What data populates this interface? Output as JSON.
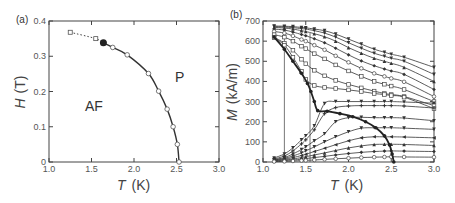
{
  "chart_data": [
    {
      "panel": "(a)",
      "type": "line",
      "title": "",
      "xlabel": "T (K)",
      "ylabel": "H (T)",
      "xlim": [
        1.0,
        3.0
      ],
      "ylim": [
        0,
        0.4
      ],
      "xticks": [
        "1.0",
        "1.5",
        "2.0",
        "2.5",
        "3.0"
      ],
      "yticks": [
        "0",
        "0.1",
        "0.2",
        "0.3",
        "0.4"
      ],
      "grid": false,
      "annotations": [
        "AF",
        "P"
      ],
      "series": [
        {
          "name": "phase boundary (solid)",
          "style": "solid with open circles",
          "x": [
            1.64,
            1.75,
            1.92,
            2.17,
            2.29,
            2.39,
            2.46,
            2.51,
            2.53
          ],
          "y": [
            0.338,
            0.325,
            0.304,
            0.251,
            0.201,
            0.15,
            0.1,
            0.05,
            0.0
          ]
        },
        {
          "name": "tricritical point",
          "style": "filled circle",
          "x": [
            1.64
          ],
          "y": [
            0.338
          ]
        },
        {
          "name": "first-order boundary (dotted)",
          "style": "dotted with open squares",
          "x": [
            1.25,
            1.55,
            1.64
          ],
          "y": [
            0.368,
            0.35,
            0.338
          ]
        }
      ]
    },
    {
      "panel": "(b)",
      "type": "line",
      "title": "",
      "xlabel": "T (K)",
      "ylabel": "M (kA/m)",
      "xlim": [
        1.0,
        3.0
      ],
      "ylim": [
        0,
        700
      ],
      "xticks": [
        "1.0",
        "1.5",
        "2.0",
        "2.5",
        "3.0"
      ],
      "yticks": [
        "0",
        "100",
        "200",
        "300",
        "400",
        "500",
        "600",
        "700"
      ],
      "grid": false,
      "x": [
        1.13,
        1.25,
        1.35,
        1.45,
        1.5,
        1.6,
        1.72,
        1.85,
        2.0,
        2.15,
        2.3,
        2.42,
        2.5,
        2.65,
        3.0
      ],
      "series": [
        {
          "name": "H1",
          "values": [
            675,
            674,
            672,
            668,
            666,
            660,
            652,
            635,
            610,
            585,
            560,
            545,
            535,
            520,
            470
          ]
        },
        {
          "name": "H2",
          "values": [
            672,
            670,
            667,
            662,
            660,
            652,
            640,
            620,
            592,
            565,
            540,
            525,
            515,
            500,
            435
          ]
        },
        {
          "name": "H3",
          "values": [
            668,
            665,
            660,
            652,
            648,
            637,
            622,
            600,
            568,
            540,
            515,
            500,
            490,
            470,
            400
          ]
        },
        {
          "name": "H4",
          "values": [
            660,
            655,
            645,
            633,
            627,
            612,
            592,
            565,
            532,
            502,
            478,
            462,
            452,
            435,
            360
          ]
        },
        {
          "name": "H5",
          "values": [
            648,
            640,
            626,
            608,
            600,
            580,
            557,
            527,
            495,
            465,
            440,
            425,
            415,
            398,
            325
          ]
        },
        {
          "name": "H6",
          "values": [
            632,
            620,
            600,
            575,
            563,
            538,
            512,
            482,
            452,
            425,
            400,
            386,
            377,
            360,
            300
          ]
        },
        {
          "name": "H7",
          "values": [
            620,
            590,
            555,
            510,
            488,
            455,
            428,
            405,
            385,
            368,
            352,
            340,
            335,
            325,
            280
          ]
        },
        {
          "name": "H8",
          "values": [
            618,
            580,
            520,
            450,
            410,
            380,
            370,
            365,
            358,
            350,
            340,
            335,
            330,
            322,
            265
          ]
        },
        {
          "name": "H9",
          "values": [
            20,
            40,
            70,
            110,
            130,
            180,
            290,
            300,
            300,
            300,
            300,
            300,
            300,
            298,
            292
          ]
        },
        {
          "name": "H10",
          "values": [
            15,
            30,
            55,
            90,
            110,
            160,
            240,
            270,
            278,
            280,
            280,
            280,
            280,
            278,
            268
          ]
        },
        {
          "name": "H11",
          "values": [
            12,
            22,
            40,
            62,
            75,
            105,
            140,
            200,
            220,
            222,
            220,
            220,
            220,
            218,
            205
          ]
        },
        {
          "name": "H12",
          "values": [
            10,
            18,
            30,
            45,
            55,
            75,
            100,
            125,
            150,
            168,
            170,
            170,
            170,
            168,
            162
          ]
        },
        {
          "name": "H13",
          "values": [
            8,
            14,
            22,
            32,
            38,
            52,
            68,
            86,
            105,
            120,
            125,
            125,
            125,
            124,
            120
          ]
        },
        {
          "name": "H14",
          "values": [
            6,
            10,
            15,
            22,
            26,
            35,
            45,
            57,
            70,
            80,
            87,
            88,
            88,
            87,
            82
          ]
        },
        {
          "name": "H15",
          "values": [
            4,
            7,
            10,
            14,
            17,
            22,
            28,
            35,
            42,
            48,
            52,
            54,
            55,
            54,
            52
          ]
        },
        {
          "name": "H16",
          "values": [
            2,
            3,
            5,
            7,
            8,
            10,
            13,
            16,
            19,
            22,
            24,
            25,
            26,
            25,
            24
          ]
        }
      ],
      "phase_boundary": {
        "x": [
          1.13,
          1.25,
          1.35,
          1.45,
          1.52,
          1.56,
          1.6,
          1.64,
          1.75,
          1.9,
          2.05,
          2.2,
          2.32,
          2.42,
          2.48,
          2.51,
          2.53
        ],
        "y": [
          620,
          560,
          500,
          440,
          390,
          350,
          300,
          255,
          252,
          240,
          225,
          200,
          170,
          130,
          85,
          40,
          0
        ]
      },
      "vertical_lines": [
        1.25,
        1.55
      ]
    }
  ],
  "panels": {
    "a": {
      "label": "(a)",
      "region_af": "AF",
      "region_p": "P",
      "xlabel_var": "T",
      "xlabel_unit": "(K)",
      "ylabel_var": "H",
      "ylabel_unit": "(T)"
    },
    "b": {
      "label": "(b)",
      "xlabel_var": "T",
      "xlabel_unit": "(K)",
      "ylabel_var": "M",
      "ylabel_unit": "(kA/m)"
    }
  }
}
